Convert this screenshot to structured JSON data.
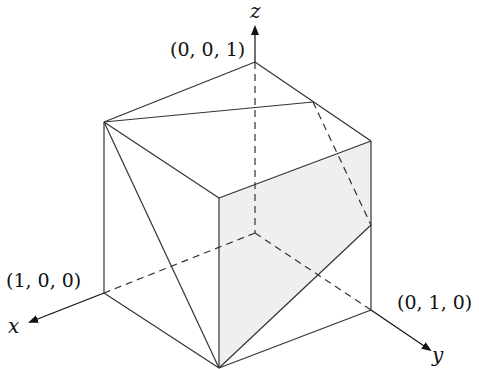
{
  "diagram": {
    "axes": {
      "x": {
        "label": "x"
      },
      "y": {
        "label": "y"
      },
      "z": {
        "label": "z"
      }
    },
    "vertex_labels": {
      "z_unit": "(0, 0, 1)",
      "x_unit": "(1, 0, 0)",
      "y_unit": "(0, 1, 0)"
    },
    "colors": {
      "shaded_face": "#efefef",
      "line": "#333333"
    }
  }
}
